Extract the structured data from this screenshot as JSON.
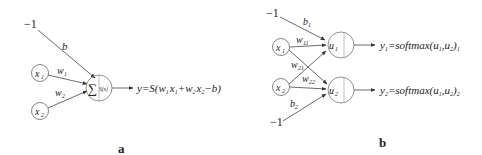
{
  "diagram_a": {
    "bias_input": "−1",
    "bias_weight": "b",
    "inputs": [
      {
        "var": "x",
        "sub": "1",
        "weight_var": "w",
        "weight_sub": "1"
      },
      {
        "var": "x",
        "sub": "2",
        "weight_var": "w",
        "weight_sub": "2"
      }
    ],
    "neuron": {
      "sum_symbol": "∑",
      "activation": "S(x)"
    },
    "output_formula": "y=S(w₁x₁+w₂x₂−b)",
    "output_parts": {
      "lhs": "y=S(",
      "w1": "w",
      "w1_sub": "1",
      "x1": "x",
      "x1_sub": "1",
      "plus": "+",
      "w2": "w",
      "w2_sub": "2",
      "x2": "x",
      "x2_sub": "2",
      "tail": "−b)"
    },
    "caption": "a"
  },
  "diagram_b": {
    "bias_inputs": [
      "−1",
      "−1"
    ],
    "bias_weights": [
      {
        "var": "b",
        "sub": "1"
      },
      {
        "var": "b",
        "sub": "2"
      }
    ],
    "inputs": [
      {
        "var": "x",
        "sub": "1"
      },
      {
        "var": "x",
        "sub": "2"
      }
    ],
    "weights": [
      {
        "var": "w",
        "sub": "11"
      },
      {
        "var": "w",
        "sub": "21"
      },
      {
        "var": "w",
        "sub": "22"
      }
    ],
    "neurons": [
      {
        "var": "u",
        "sub": "1"
      },
      {
        "var": "u",
        "sub": "2"
      }
    ],
    "outputs": [
      {
        "text": "y₁=softmax(u₁,u₂)₁",
        "y_sub": "1",
        "lhs": "=",
        "fn": "softmax",
        "args": "(u",
        "a1_sub": "1",
        "mid": ",u",
        "a2_sub": "2",
        "close": ")",
        "out_sub": "1"
      },
      {
        "text": "y₂=softmax(u₁,u₂)₂",
        "y_sub": "2",
        "lhs": "=",
        "fn": "softmax",
        "args": "(u",
        "a1_sub": "1",
        "mid": ",u",
        "a2_sub": "2",
        "close": ")",
        "out_sub": "2"
      }
    ],
    "caption": "b"
  },
  "colors": {
    "line": "#444444",
    "text": "#222222",
    "background": "#ffffff"
  }
}
